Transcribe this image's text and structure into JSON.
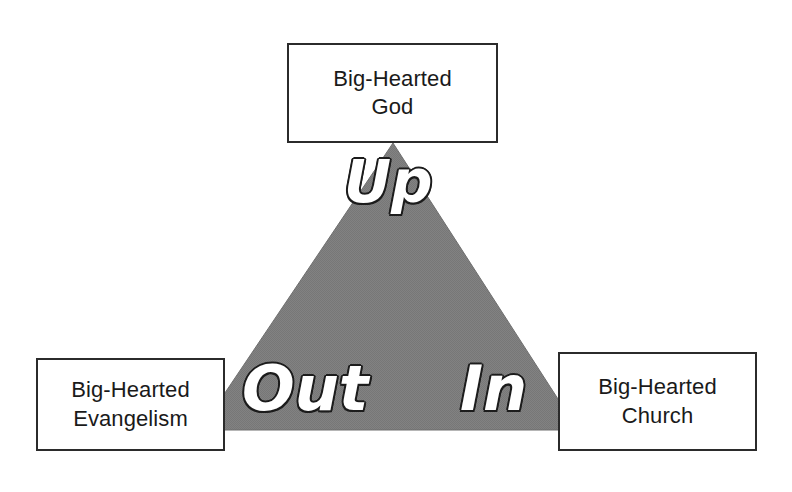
{
  "diagram": {
    "background_color": "#ffffff",
    "triangle": {
      "fill_color": "#808080",
      "stroke_color": "#6e6e6e",
      "apex": {
        "x": 393,
        "y": 143
      },
      "base_left": {
        "x": 200,
        "y": 430
      },
      "base_right": {
        "x": 578,
        "y": 430
      }
    },
    "nodes": [
      {
        "id": "god",
        "label": "Big-Hearted\nGod",
        "position": "top",
        "border_color": "#2b2b2b",
        "fill_color": "#ffffff",
        "text_color": "#1a1a1a"
      },
      {
        "id": "evangelism",
        "label": "Big-Hearted\nEvangelism",
        "position": "bottom-left",
        "border_color": "#2b2b2b",
        "fill_color": "#ffffff",
        "text_color": "#1a1a1a"
      },
      {
        "id": "church",
        "label": "Big-Hearted\nChurch",
        "position": "bottom-right",
        "border_color": "#2b2b2b",
        "fill_color": "#ffffff",
        "text_color": "#1a1a1a"
      }
    ],
    "edge_labels": [
      {
        "id": "up",
        "text": "Up",
        "edge": "apex",
        "text_color": "#ffffff",
        "outline_color": "#1c1c1c"
      },
      {
        "id": "out",
        "text": "Out",
        "edge": "bottom-left",
        "text_color": "#ffffff",
        "outline_color": "#1c1c1c"
      },
      {
        "id": "in",
        "text": "In",
        "edge": "bottom-right",
        "text_color": "#ffffff",
        "outline_color": "#1c1c1c"
      }
    ]
  }
}
